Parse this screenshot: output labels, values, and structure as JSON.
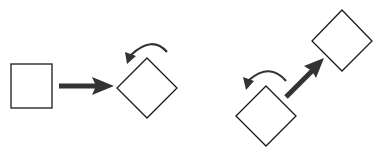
{
  "diagram": {
    "colors": {
      "background": "#ffffff",
      "outline": "#1a1a1a",
      "arrow": "#333333"
    },
    "shapes": [
      {
        "id": "square-start",
        "type": "square",
        "rotation": 0
      },
      {
        "id": "diamond-rotated",
        "type": "square",
        "rotation": 45
      },
      {
        "id": "diamond-lower",
        "type": "square",
        "rotation": 45
      },
      {
        "id": "diamond-upper",
        "type": "square",
        "rotation": 45
      }
    ],
    "arrows": [
      {
        "id": "translate-right",
        "type": "straight"
      },
      {
        "id": "rotate-ccw-1",
        "type": "curved"
      },
      {
        "id": "translate-diagonal",
        "type": "straight"
      },
      {
        "id": "rotate-ccw-2",
        "type": "curved"
      }
    ]
  }
}
